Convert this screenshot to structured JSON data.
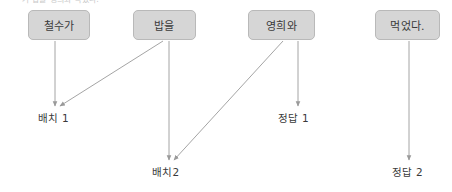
{
  "diagram": {
    "clipped_header_text": "가 밥을 영희와 먹었다.",
    "colors": {
      "node_fill": "#d6d6d6",
      "node_border": "#b9b9b9",
      "edge": "#9a9a9a",
      "text": "#3a3a3a",
      "background": "#ffffff"
    },
    "nodes": [
      {
        "id": "n1",
        "label": "철수가",
        "x": 28,
        "y": 10,
        "w": 62,
        "h": 30
      },
      {
        "id": "n2",
        "label": "밥을",
        "x": 133,
        "y": 10,
        "w": 63,
        "h": 30
      },
      {
        "id": "n3",
        "label": "영희와",
        "x": 248,
        "y": 10,
        "w": 67,
        "h": 30
      },
      {
        "id": "n4",
        "label": "먹었다.",
        "x": 375,
        "y": 10,
        "w": 65,
        "h": 30
      }
    ],
    "slots": [
      {
        "id": "s1",
        "label": "배치 1",
        "x": 38,
        "y": 110
      },
      {
        "id": "s2",
        "label": "배치2",
        "x": 152,
        "y": 164
      },
      {
        "id": "s3",
        "label": "정답 1",
        "x": 278,
        "y": 110
      },
      {
        "id": "s4",
        "label": "정답 2",
        "x": 392,
        "y": 164
      }
    ],
    "edges": [
      {
        "from": "철수가",
        "to": "배치 1",
        "x1": 55,
        "y1": 41,
        "x2": 55,
        "y2": 106,
        "kind": "vertical"
      },
      {
        "from": "밥을",
        "to": "배치 1",
        "x1": 163,
        "y1": 41,
        "x2": 60,
        "y2": 106,
        "kind": "diagonal"
      },
      {
        "from": "밥을",
        "to": "배치2",
        "x1": 169,
        "y1": 41,
        "x2": 169,
        "y2": 160,
        "kind": "vertical"
      },
      {
        "from": "영희와",
        "to": "배치2",
        "x1": 283,
        "y1": 41,
        "x2": 174,
        "y2": 160,
        "kind": "diagonal"
      },
      {
        "from": "영희와",
        "to": "정답 1",
        "x1": 298,
        "y1": 41,
        "x2": 298,
        "y2": 106,
        "kind": "vertical"
      },
      {
        "from": "먹었다.",
        "to": "정답 2",
        "x1": 409,
        "y1": 41,
        "x2": 409,
        "y2": 160,
        "kind": "vertical"
      }
    ]
  }
}
